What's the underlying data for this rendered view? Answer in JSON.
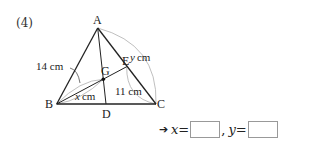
{
  "problem": {
    "number": "(4)"
  },
  "diagram": {
    "points": {
      "A": {
        "label": "A",
        "x": 97.7,
        "y": 28
      },
      "B": {
        "label": "B",
        "x": 56.7,
        "y": 104
      },
      "C": {
        "label": "C",
        "x": 156,
        "y": 104
      },
      "D": {
        "label": "D",
        "x": 106,
        "y": 104
      },
      "E": {
        "label": "E",
        "x": 126.7,
        "y": 66.7
      },
      "G": {
        "label": "G",
        "x": 103.3,
        "y": 79.3
      }
    },
    "measurements": {
      "AB": "14 cm",
      "BG": "x cm",
      "BG_var": "x",
      "BG_unit": "cm",
      "EC": "11 cm",
      "AC": "y cm",
      "AC_var": "y",
      "AC_unit": "cm"
    },
    "colors": {
      "line": "#222222",
      "arc": "#b8b8b8"
    }
  },
  "answer": {
    "arrow": "➔",
    "x_var": "x",
    "y_var": "y",
    "equals": "=",
    "separator": ","
  }
}
